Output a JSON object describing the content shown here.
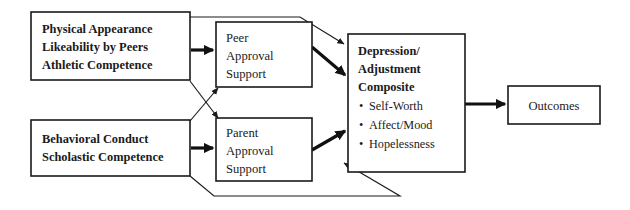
{
  "diagram": {
    "type": "path-model-flow-diagram",
    "background_color": "#ffffff",
    "line_color": "#1a1a1a",
    "nodes": {
      "peer_predictors": {
        "id": "peer-predictors-box",
        "lines": [
          "Physical Appearance",
          "Likeability by Peers",
          "Athletic Competence"
        ],
        "style": "bold"
      },
      "peer_approval": {
        "id": "peer-approval-box",
        "lines": [
          "Peer",
          "Approval",
          "Support"
        ],
        "style": "plain"
      },
      "parent_predictors": {
        "id": "parent-predictors-box",
        "lines": [
          "Behavioral Conduct",
          "Scholastic Competence"
        ],
        "style": "bold"
      },
      "parent_approval": {
        "id": "parent-approval-box",
        "lines": [
          "Parent",
          "Approval",
          "Support"
        ],
        "style": "plain"
      },
      "composite": {
        "id": "depression-adjustment-composite-box",
        "heading_lines": [
          "Depression/",
          "Adjustment",
          "Composite"
        ],
        "bullet_char": "•",
        "bullets": [
          "Self-Worth",
          "Affect/Mood",
          "Hopelessness"
        ]
      },
      "outcomes": {
        "id": "outcomes-box",
        "lines": [
          "Outcomes"
        ],
        "style": "plain"
      }
    },
    "edges": [
      {
        "name": "peer-predictors-to-peer-approval",
        "from": "peer_predictors",
        "to": "peer_approval",
        "weight": "thick"
      },
      {
        "name": "peer-predictors-to-parent-approval",
        "from": "peer_predictors",
        "to": "parent_approval",
        "weight": "thin"
      },
      {
        "name": "peer-predictors-to-composite",
        "from": "peer_predictors",
        "to": "composite",
        "weight": "thin"
      },
      {
        "name": "parent-predictors-to-parent-approval",
        "from": "parent_predictors",
        "to": "parent_approval",
        "weight": "thick"
      },
      {
        "name": "parent-predictors-to-peer-approval",
        "from": "parent_predictors",
        "to": "peer_approval",
        "weight": "thin"
      },
      {
        "name": "parent-predictors-to-composite",
        "from": "parent_predictors",
        "to": "composite",
        "weight": "thin"
      },
      {
        "name": "peer-approval-to-composite",
        "from": "peer_approval",
        "to": "composite",
        "weight": "thick"
      },
      {
        "name": "parent-approval-to-composite",
        "from": "parent_approval",
        "to": "composite",
        "weight": "thick"
      },
      {
        "name": "composite-to-outcomes",
        "from": "composite",
        "to": "outcomes",
        "weight": "thick"
      }
    ]
  }
}
